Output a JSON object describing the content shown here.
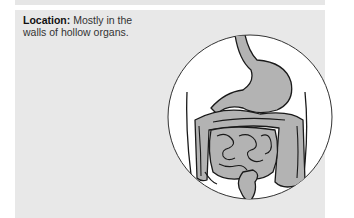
{
  "caption": {
    "label": "Location:",
    "text": " Mostly in the walls of hollow organs."
  },
  "illustration": {
    "subject": "digestive-tract-in-abdomen",
    "organ_fill": "#b3b3b3",
    "circle_fill": "#ffffff",
    "outline": "#1a1a1a"
  },
  "colors": {
    "panel_bg": "#e8e8e8",
    "page_bg": "#ffffff",
    "text": "#333333"
  }
}
